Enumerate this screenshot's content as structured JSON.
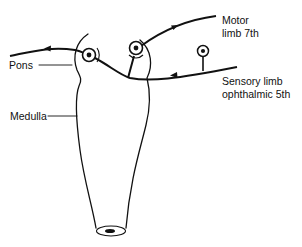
{
  "diagram": {
    "labels": {
      "pons": "Pons",
      "medulla": "Medulla",
      "motor_line1": "Motor",
      "motor_line2": "limb 7th",
      "sensory_line1": "Sensory limb",
      "sensory_line2": "ophthalmic 5th"
    },
    "colors": {
      "stroke": "#111111",
      "background": "#ffffff"
    }
  }
}
